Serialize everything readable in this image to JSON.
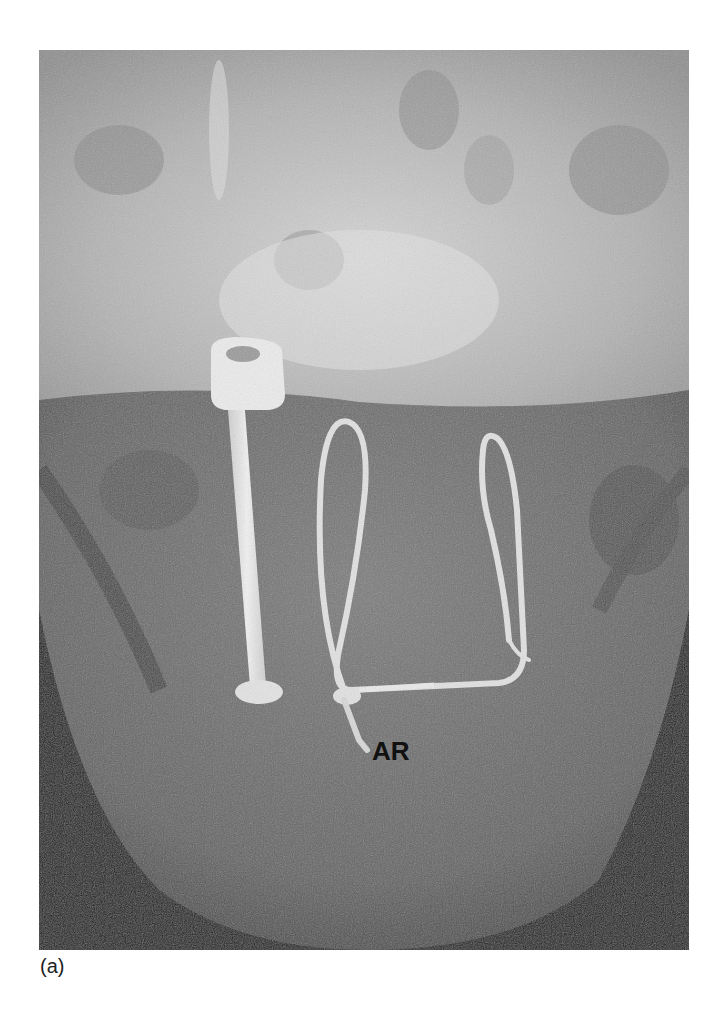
{
  "figure": {
    "panel_label": "(a)",
    "annotation": "AR",
    "colors": {
      "background": "#ffffff",
      "upper_skull": "#b9b9b9",
      "soft_tissue": "#707070",
      "dark_edges": "#141414",
      "device": "#e6e6e6",
      "annotation_text": "#111111"
    }
  }
}
